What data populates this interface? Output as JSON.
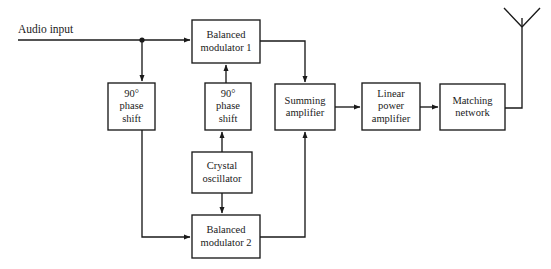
{
  "diagram": {
    "type": "block-diagram",
    "background_color": "#ffffff",
    "line_color": "#1a1a1a",
    "text_color": "#1a1a1a",
    "labels": {
      "audio_input": "Audio input"
    },
    "blocks": [
      {
        "id": "phase-shift-audio",
        "lines": [
          "90°",
          "phase",
          "shift"
        ],
        "x": 108,
        "y": 83,
        "w": 47,
        "h": 47
      },
      {
        "id": "balanced-modulator-1",
        "lines": [
          "Balanced",
          "modulator 1"
        ],
        "x": 192,
        "y": 20,
        "w": 68,
        "h": 43
      },
      {
        "id": "phase-shift-carrier",
        "lines": [
          "90°",
          "phase",
          "shift"
        ],
        "x": 205,
        "y": 83,
        "w": 46,
        "h": 47
      },
      {
        "id": "crystal-oscillator",
        "lines": [
          "Crystal",
          "oscillator"
        ],
        "x": 192,
        "y": 152,
        "w": 60,
        "h": 41
      },
      {
        "id": "balanced-modulator-2",
        "lines": [
          "Balanced",
          "modulator 2"
        ],
        "x": 192,
        "y": 215,
        "w": 68,
        "h": 43
      },
      {
        "id": "summing-amplifier",
        "lines": [
          "Summing",
          "amplifier"
        ],
        "x": 275,
        "y": 84,
        "w": 60,
        "h": 46
      },
      {
        "id": "linear-power-amplifier",
        "lines": [
          "Linear",
          "power",
          "amplifier"
        ],
        "x": 362,
        "y": 83,
        "w": 58,
        "h": 47
      },
      {
        "id": "matching-network",
        "lines": [
          "Matching",
          "network"
        ],
        "x": 440,
        "y": 84,
        "w": 65,
        "h": 46
      }
    ],
    "connections": [
      {
        "id": "audio-in-to-bm1",
        "from": "audio-input",
        "to": "balanced-modulator-1"
      },
      {
        "id": "audio-tap-to-phase-shift",
        "from": "audio-input",
        "to": "phase-shift-audio"
      },
      {
        "id": "phase-shift-audio-to-bm2",
        "from": "phase-shift-audio",
        "to": "balanced-modulator-2"
      },
      {
        "id": "crystal-to-phase-shift-carrier",
        "from": "crystal-oscillator",
        "to": "phase-shift-carrier"
      },
      {
        "id": "phase-shift-carrier-to-bm1",
        "from": "phase-shift-carrier",
        "to": "balanced-modulator-1"
      },
      {
        "id": "crystal-to-bm2",
        "from": "crystal-oscillator",
        "to": "balanced-modulator-2"
      },
      {
        "id": "bm1-to-summing",
        "from": "balanced-modulator-1",
        "to": "summing-amplifier"
      },
      {
        "id": "bm2-to-summing",
        "from": "balanced-modulator-2",
        "to": "summing-amplifier"
      },
      {
        "id": "summing-to-lpa",
        "from": "summing-amplifier",
        "to": "linear-power-amplifier"
      },
      {
        "id": "lpa-to-matching",
        "from": "linear-power-amplifier",
        "to": "matching-network"
      },
      {
        "id": "matching-to-antenna",
        "from": "matching-network",
        "to": "antenna"
      }
    ],
    "antenna": {
      "id": "antenna",
      "mast_x": 522,
      "top_y": 8,
      "base_y": 108
    }
  }
}
